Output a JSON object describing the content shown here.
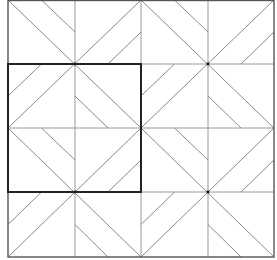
{
  "diagram": {
    "type": "quilt-block-tessellation",
    "grid": {
      "x_lines": [
        8,
        75,
        141,
        208,
        274
      ],
      "y_lines": [
        0,
        64,
        128,
        192,
        257
      ]
    },
    "blocks": [
      {
        "cx": 75,
        "cy": 64,
        "x0": 8,
        "y0": 0,
        "x1": 141,
        "y1": 128
      },
      {
        "cx": 208,
        "cy": 64,
        "x0": 141,
        "y0": 0,
        "x1": 274,
        "y1": 128
      },
      {
        "cx": 75,
        "cy": 192,
        "x0": 8,
        "y0": 128,
        "x1": 141,
        "y1": 257
      },
      {
        "cx": 208,
        "cy": 192,
        "x0": 141,
        "y0": 128,
        "x1": 274,
        "y1": 257
      }
    ],
    "highlight_square": {
      "x0": 8,
      "y0": 64,
      "x1": 141,
      "y1": 192
    },
    "colors": {
      "background": "#ffffff",
      "thin_line": "#8a8a8a",
      "grid_line": "#9a9a9a",
      "outer_border": "#555555",
      "highlight": "#222222",
      "center_dot": "#111111"
    },
    "stroke": {
      "thin": 1,
      "outer": 1.4,
      "highlight": 2
    }
  }
}
